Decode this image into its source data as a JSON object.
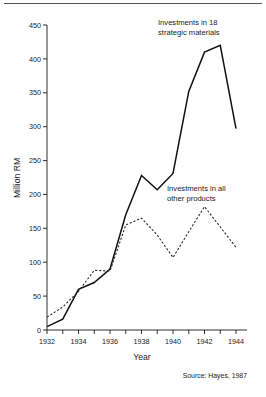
{
  "figure": {
    "top_rule": "divider",
    "source_note": "Source: Hayes, 1987"
  },
  "chart_data": {
    "type": "line",
    "title": "",
    "xlabel": "Year",
    "ylabel": "Million RM",
    "x": [
      1932,
      1933,
      1934,
      1935,
      1936,
      1937,
      1938,
      1939,
      1940,
      1941,
      1942,
      1943,
      1944
    ],
    "xlim": [
      1932,
      1944.6
    ],
    "ylim": [
      0,
      450
    ],
    "xticks": [
      1932,
      1933,
      1934,
      1935,
      1936,
      1937,
      1938,
      1939,
      1940,
      1941,
      1942,
      1943,
      1944
    ],
    "xticklabels": [
      "1932",
      "",
      "1934",
      "",
      "1936",
      "",
      "1938",
      "",
      "1940",
      "",
      "1942",
      "",
      "1944"
    ],
    "yticks": [
      0,
      50,
      100,
      150,
      200,
      250,
      300,
      350,
      400,
      450
    ],
    "yticklabels": [
      "0",
      "50",
      "100",
      "150",
      "200",
      "250",
      "300",
      "350",
      "400",
      "450"
    ],
    "grid": false,
    "legend": "annotations",
    "series": [
      {
        "name": "Investments in 18 strategic materials",
        "style": "solid",
        "color": "#111111",
        "values": [
          5,
          16,
          60,
          70,
          90,
          170,
          228,
          207,
          231,
          352,
          410,
          420,
          297
        ]
      },
      {
        "name": "Investments in all other products",
        "style": "dashed",
        "color": "#2b2b2b",
        "values": [
          19,
          34,
          57,
          88,
          87,
          155,
          165,
          140,
          107,
          145,
          182,
          152,
          122
        ]
      }
    ],
    "annotations": [
      {
        "id": "annotation-strategic",
        "lines": [
          "Investments in 18",
          "strategic materials"
        ]
      },
      {
        "id": "annotation-other",
        "lines": [
          "Investments in all",
          "other products"
        ]
      }
    ]
  }
}
